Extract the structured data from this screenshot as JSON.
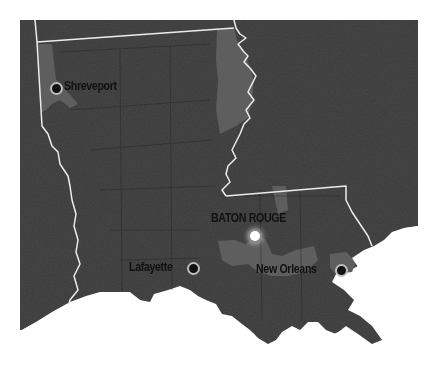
{
  "map": {
    "region": "Louisiana",
    "colors": {
      "land": "#3a3a3a",
      "highlight": "#5e5e5e",
      "border": "#e8e8e8",
      "water": "#ffffff",
      "label": "#111111"
    },
    "cities": [
      {
        "name": "Shreveport",
        "type": "city"
      },
      {
        "name": "BATON ROUGE",
        "type": "capital"
      },
      {
        "name": "Lafayette",
        "type": "city"
      },
      {
        "name": "New Orleans",
        "type": "city"
      }
    ]
  }
}
